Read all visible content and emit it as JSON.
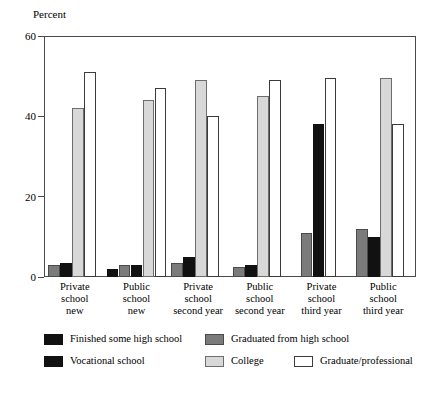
{
  "chart_data": {
    "type": "bar",
    "title": "",
    "subtitle": "",
    "xlabel": "",
    "ylabel": "Percent",
    "ylim": [
      0,
      60
    ],
    "yticks": [
      0,
      20,
      40,
      60
    ],
    "ytick_labels": [
      "0",
      "20",
      "40",
      "60"
    ],
    "grid": false,
    "legend_position": "bottom",
    "categories": [
      "Private school new",
      "Public school new",
      "Private school second year",
      "Public school second year",
      "Private school third year",
      "Public school third year"
    ],
    "category_label_lines": [
      [
        "Private",
        "school",
        "new"
      ],
      [
        "Public",
        "school",
        "new"
      ],
      [
        "Private",
        "school",
        "second year"
      ],
      [
        "Public",
        "school",
        "second year"
      ],
      [
        "Private",
        "school",
        "third year"
      ],
      [
        "Public",
        "school",
        "third year"
      ]
    ],
    "series": [
      {
        "name": "Finished some high school",
        "key": "finished",
        "color": "#111111",
        "values": [
          null,
          2,
          null,
          null,
          null,
          null
        ]
      },
      {
        "name": "Graduated from  high school",
        "key": "graduated",
        "color": "#7b7b7b",
        "values": [
          3,
          3,
          3.5,
          2.5,
          11,
          12
        ]
      },
      {
        "name": "Vocational school",
        "key": "vocational",
        "color": "#111111",
        "values": [
          3.5,
          3,
          5,
          3,
          38,
          10
        ]
      },
      {
        "name": "College",
        "key": "college",
        "color": "#d8d8d8",
        "values": [
          42,
          44,
          49,
          45,
          null,
          49.5
        ]
      },
      {
        "name": "Graduate/professional",
        "key": "graduate",
        "color": "#ffffff",
        "values": [
          51,
          47,
          40,
          49,
          49.5,
          38
        ]
      }
    ],
    "legend_entries": [
      {
        "label": "Finished some high school",
        "key": "finished"
      },
      {
        "label": "Graduated from  high school",
        "key": "graduated"
      },
      {
        "label": "Vocational school",
        "key": "vocational"
      },
      {
        "label": "College",
        "key": "college"
      },
      {
        "label": "Graduate/professional",
        "key": "graduate"
      }
    ]
  }
}
